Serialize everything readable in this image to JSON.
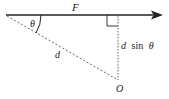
{
  "diagram": {
    "colors": {
      "line": "#222222",
      "dashed": "#666666",
      "background": "#ffffff"
    },
    "labels": {
      "force": "F",
      "angle": "θ",
      "distance": "d",
      "lever_arm_d": "d",
      "lever_arm_sin": "sin",
      "lever_arm_theta": "θ",
      "pivot": "O"
    },
    "geometry": {
      "force_line": {
        "x1": 6,
        "y1": 15,
        "x2": 152,
        "y2": 15
      },
      "arrowhead": {
        "tip_x": 163,
        "y": 15
      },
      "dashed_line": {
        "x1": 7,
        "y1": 16,
        "x2": 118,
        "y2": 80
      },
      "perpendicular": {
        "x": 118,
        "y1": 15,
        "y2": 80
      },
      "right_angle_box": {
        "x": 107,
        "y": 15,
        "size": 11
      }
    }
  }
}
